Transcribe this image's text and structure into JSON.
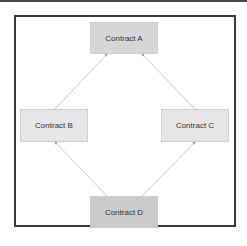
{
  "diagram": {
    "type": "inheritance-diamond",
    "nodes": [
      {
        "id": "A",
        "label": "Contract A"
      },
      {
        "id": "B",
        "label": "Contract B"
      },
      {
        "id": "C",
        "label": "Contract C"
      },
      {
        "id": "D",
        "label": "Contract D"
      }
    ],
    "edges": [
      {
        "from": "B",
        "to": "A"
      },
      {
        "from": "C",
        "to": "A"
      },
      {
        "from": "D",
        "to": "B"
      },
      {
        "from": "D",
        "to": "C"
      }
    ],
    "colors": {
      "frame_border": "#3a3a3a",
      "node_fill_A": "#d6d6d6",
      "node_fill_BC": "#e6e6e6",
      "node_fill_D": "#cbcbcb",
      "edge": "#bbbbbb"
    }
  }
}
